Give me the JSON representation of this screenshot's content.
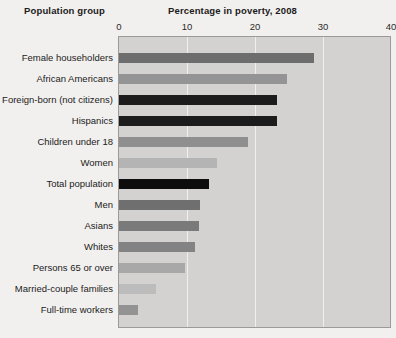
{
  "header": {
    "category_axis_title": "Population group",
    "value_axis_title": "Percentage in poverty, 2008"
  },
  "colors": {
    "page_background": "#f2f0ee",
    "plot_background": "#d3d2d0",
    "plot_border": "#9a9a98",
    "gridline": "#f0efed",
    "text": "#1b1b1b"
  },
  "chart_data": {
    "type": "bar",
    "orientation": "horizontal",
    "title": "Percentage in poverty, 2008",
    "xlabel": "Percentage in poverty, 2008",
    "ylabel": "Population group",
    "xlim": [
      0,
      40
    ],
    "xticks": [
      0,
      10,
      20,
      30,
      40
    ],
    "xtick_labels": [
      "0",
      "10",
      "20",
      "30",
      "40"
    ],
    "grid": true,
    "legend": "none",
    "categories": [
      "Female householders",
      "African Americans",
      "Foreign-born (not citizens)",
      "Hispanics",
      "Children under 18",
      "Women",
      "Total population",
      "Men",
      "Asians",
      "Whites",
      "Persons 65 or over",
      "Married-couple families",
      "Full-time workers"
    ],
    "values": [
      28.7,
      24.7,
      23.3,
      23.2,
      19.0,
      14.4,
      13.2,
      11.9,
      11.8,
      11.2,
      9.7,
      5.5,
      2.8
    ],
    "bar_colors": [
      "#6d6d6d",
      "#949494",
      "#1c1c1c",
      "#1c1c1c",
      "#8f8f8f",
      "#b4b4b4",
      "#0d0d0d",
      "#6f6f6f",
      "#7a7a7a",
      "#838383",
      "#a8a8a8",
      "#bcbcbc",
      "#939393"
    ]
  }
}
